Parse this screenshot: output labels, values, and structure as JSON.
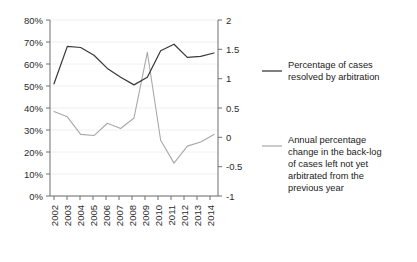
{
  "chart_data": {
    "type": "line",
    "title": "",
    "xlabel": "",
    "ylabel": "",
    "grid": true,
    "legend_position": "right",
    "x": [
      "2002",
      "2003",
      "2004",
      "2005",
      "2006",
      "2007",
      "2008",
      "2009",
      "2010",
      "2011",
      "2012",
      "2013",
      "2014"
    ],
    "left_axis": {
      "ticks": [
        "0%",
        "10%",
        "20%",
        "30%",
        "40%",
        "50%",
        "60%",
        "70%",
        "80%"
      ],
      "tick_values": [
        0,
        10,
        20,
        30,
        40,
        50,
        60,
        70,
        80
      ],
      "ylim": [
        0,
        80
      ]
    },
    "right_axis": {
      "ticks": [
        "-1",
        "-0.5",
        "0",
        "0.5",
        "1",
        "1.5",
        "2"
      ],
      "tick_values": [
        -1,
        -0.5,
        0,
        0.5,
        1,
        1.5,
        2
      ],
      "ylim": [
        -1,
        2
      ]
    },
    "series": [
      {
        "name": "Percentage of cases resolved by arbitration",
        "axis": "left",
        "color": "#3a3a3a",
        "values": [
          51,
          68,
          67.5,
          64,
          58,
          54,
          50.5,
          54,
          66,
          69,
          63,
          63.5,
          65
        ]
      },
      {
        "name": "Annual percentage change in the back-log of cases left not yet arbitrated from the previous year",
        "axis": "right",
        "color": "#a8a8a8",
        "values": [
          0.44,
          0.35,
          0.05,
          0.03,
          0.24,
          0.15,
          0.33,
          1.45,
          -0.05,
          -0.44,
          -0.15,
          -0.08,
          0.05
        ]
      }
    ]
  },
  "legend": {
    "entries": [
      {
        "label_line1": "Percentage of cases",
        "label_line2": "resolved by arbitration"
      },
      {
        "label_line1": "Annual percentage",
        "label_line2": "change in the back-log",
        "label_line3": "of cases left not yet",
        "label_line4": "arbitrated from the",
        "label_line5": "previous year"
      }
    ]
  }
}
